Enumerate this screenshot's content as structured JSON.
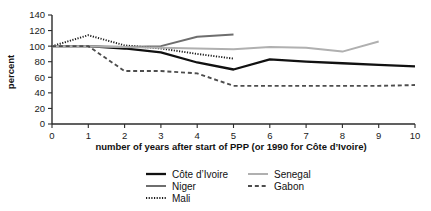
{
  "chart_data": {
    "type": "line",
    "title": "",
    "xlabel": "number of years after start of PPP (or 1990 for Côte d’Ivoire)",
    "ylabel": "percent",
    "xlim": [
      0,
      10
    ],
    "ylim": [
      0,
      140
    ],
    "grid": false,
    "legend_position": "bottom",
    "xticks": [
      "0",
      "1",
      "2",
      "3",
      "4",
      "5",
      "6",
      "7",
      "8",
      "9",
      "10"
    ],
    "yticks": [
      "0",
      "20",
      "40",
      "60",
      "80",
      "100",
      "120",
      "140"
    ],
    "series": [
      {
        "name": "Côte d’Ivoire",
        "style": "solid",
        "color": "#111111",
        "width": 2.3,
        "x": [
          0,
          1,
          2,
          3,
          4,
          5,
          6,
          7,
          8,
          9,
          10
        ],
        "values": [
          100,
          100,
          97,
          92,
          79,
          70,
          83,
          80,
          78,
          76,
          74
        ]
      },
      {
        "name": "Niger",
        "style": "solid",
        "color": "#6e6e6e",
        "width": 2.0,
        "x": [
          0,
          1,
          2,
          3,
          4,
          5
        ],
        "values": [
          100,
          100,
          99,
          100,
          112,
          115
        ]
      },
      {
        "name": "Mali",
        "style": "dotted",
        "color": "#1a1a1a",
        "width": 1.9,
        "x": [
          0,
          1,
          2,
          3,
          4,
          5
        ],
        "values": [
          100,
          114,
          101,
          97,
          90,
          84
        ]
      },
      {
        "name": "Senegal",
        "style": "solid",
        "color": "#b0b0b0",
        "width": 2.0,
        "x": [
          0,
          1,
          2,
          3,
          4,
          5,
          6,
          7,
          8,
          9
        ],
        "values": [
          100,
          100,
          99,
          98,
          97,
          96,
          99,
          98,
          93,
          106
        ]
      },
      {
        "name": "Gabon",
        "style": "dashed",
        "color": "#4d4d4d",
        "width": 1.9,
        "x": [
          0,
          1,
          2,
          3,
          4,
          5,
          6,
          7,
          8,
          9,
          10
        ],
        "values": [
          100,
          100,
          68,
          68,
          65,
          49,
          49,
          49,
          49,
          49,
          50
        ]
      }
    ]
  },
  "legend": {
    "entries": [
      {
        "label": "Côte d’Ivoire",
        "series": 0
      },
      {
        "label": "Senegal",
        "series": 3
      },
      {
        "label": "Niger",
        "series": 1
      },
      {
        "label": "Gabon",
        "series": 4
      },
      {
        "label": "Mali",
        "series": 2
      }
    ]
  },
  "colors": {
    "cote_divoire": "#111111",
    "niger": "#6e6e6e",
    "mali": "#1a1a1a",
    "senegal": "#b0b0b0",
    "gabon": "#4d4d4d",
    "axis": "#2b2b2b",
    "background": "#ffffff"
  }
}
